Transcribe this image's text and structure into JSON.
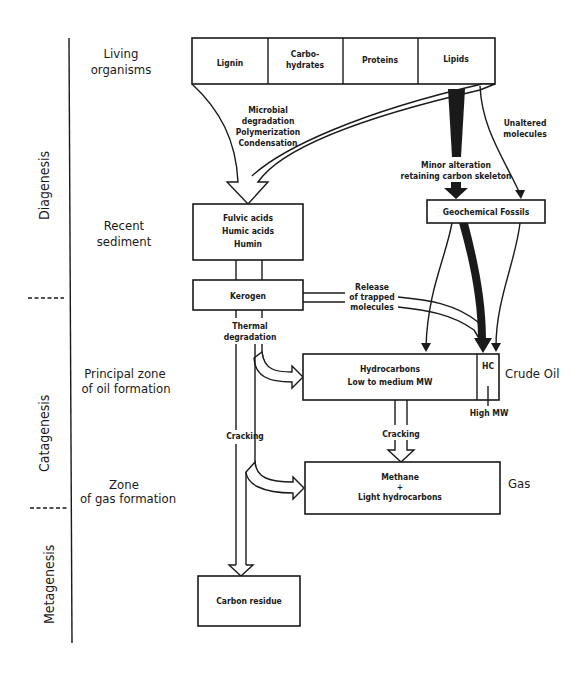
{
  "stages": [
    {
      "label": "Diagenesis"
    },
    {
      "label": "Catagenesis"
    },
    {
      "label": "Metagenesis"
    }
  ],
  "zones": {
    "living_1": "Living",
    "living_2": "organisms",
    "recent_1": "Recent",
    "recent_2": "sediment",
    "oil_1": "Principal zone",
    "oil_2": "of oil formation",
    "gas_1": "Zone",
    "gas_2": "of gas formation"
  },
  "organisms_box": {
    "cells": [
      "Lignin",
      "Carbo-",
      "hydrates",
      "Proteins",
      "Lipids"
    ]
  },
  "boxes": {
    "fulvic": [
      "Fulvic acids",
      "Humic acids",
      "Humin"
    ],
    "kerogen": "Kerogen",
    "geochemical_fossils": "Geochemical Fossils",
    "hydrocarbons": [
      "Hydrocarbons",
      "Low to medium MW"
    ],
    "hc": "HC",
    "methane": [
      "Methane",
      "+",
      "Light hydrocarbons"
    ],
    "carbon_residue": "Carbon residue"
  },
  "labels": {
    "microbial": [
      "Microbial",
      "degradation",
      "Polymerization",
      "Condensation"
    ],
    "unaltered": [
      "Unaltered",
      "molecules"
    ],
    "minor": [
      "Minor alteration",
      "retaining carbon skeleton"
    ],
    "release": [
      "Release",
      "of trapped",
      "molecules"
    ],
    "thermal": [
      "Thermal",
      "degradation"
    ],
    "cracking_left": "Cracking",
    "cracking_mid": "Cracking",
    "high_mw": "High MW",
    "crude_oil": "Crude Oil",
    "gas": "Gas"
  }
}
